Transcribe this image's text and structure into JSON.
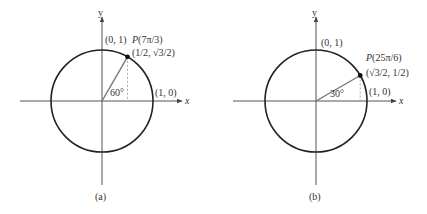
{
  "panels": [
    {
      "caption": "(a)",
      "axis_x_label": "x",
      "axis_y_label": "y",
      "label_top": "(0, 1)",
      "label_right": "(1, 0)",
      "point_name": "P",
      "point_arg": "(7π/3)",
      "point_coords": "(1/2, √3/2)",
      "angle_label": "60°",
      "angle_deg": 60
    },
    {
      "caption": "(b)",
      "axis_x_label": "x",
      "axis_y_label": "y",
      "label_top": "(0, 1)",
      "label_right": "(1, 0)",
      "point_name": "P",
      "point_arg": "(25π/6)",
      "point_coords": "(√3/2, 1/2)",
      "angle_label": "30°",
      "angle_deg": 30
    }
  ],
  "colors": {
    "stroke": "#222222",
    "axis": "#555555",
    "radius": "#777777",
    "dashed": "#999999"
  }
}
